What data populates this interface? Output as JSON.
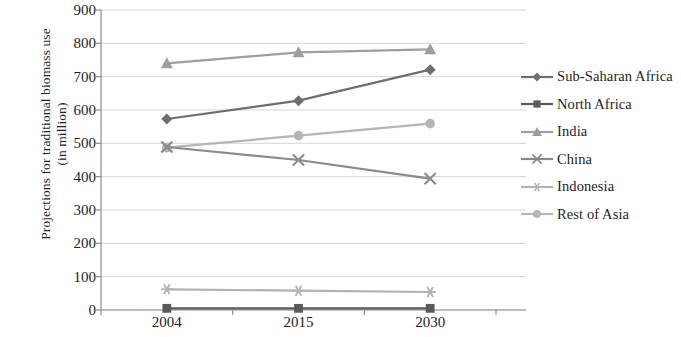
{
  "chart_data": {
    "type": "line",
    "title": "",
    "xlabel": "",
    "ylabel": "Projections for traditional biomass use (in million)",
    "ylabel_line1": "Projections for traditional biomass use",
    "ylabel_line2": "(in million)",
    "categories": [
      "2004",
      "2015",
      "2030"
    ],
    "ylim": [
      0,
      900
    ],
    "ytick_step": 100,
    "yticks": [
      "900",
      "800",
      "700",
      "600",
      "500",
      "400",
      "300",
      "200",
      "100",
      "0"
    ],
    "grid": true,
    "legend_position": "right",
    "series": [
      {
        "name": "Sub-Saharan Africa",
        "values": [
          573,
          628,
          721
        ],
        "marker": "diamond",
        "color": "#6e6e6e"
      },
      {
        "name": "North Africa",
        "values": [
          5,
          5,
          5
        ],
        "marker": "square",
        "color": "#5a5a5a"
      },
      {
        "name": "India",
        "values": [
          740,
          773,
          782
        ],
        "marker": "triangle",
        "color": "#9e9e9e"
      },
      {
        "name": "China",
        "values": [
          489,
          450,
          394
        ],
        "marker": "x",
        "color": "#8a8a8a"
      },
      {
        "name": "Indonesia",
        "values": [
          62,
          58,
          54
        ],
        "marker": "asterisk",
        "color": "#b2b2b2"
      },
      {
        "name": "Rest of Asia",
        "values": [
          487,
          523,
          559
        ],
        "marker": "circle",
        "color": "#b5b5b5"
      }
    ]
  },
  "colors": {
    "axis": "#8d8d8d",
    "grid": "#d6d6d6",
    "text": "#1e1e1e",
    "background": "#ffffff"
  }
}
